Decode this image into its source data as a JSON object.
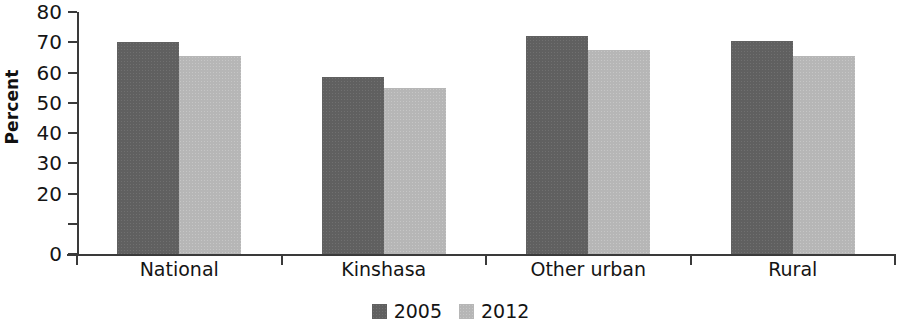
{
  "chart_data": {
    "type": "bar",
    "title": "",
    "subtitle": "",
    "xlabel": "",
    "ylabel": "Percent",
    "categories": [
      "National",
      "Kinshasa",
      "Other urban",
      "Rural"
    ],
    "series": [
      {
        "name": "2005",
        "color": "#606060",
        "values": [
          70,
          58.5,
          72,
          70.5
        ]
      },
      {
        "name": "2012",
        "color": "#b6b6b6",
        "values": [
          65.5,
          55,
          67.5,
          65.5
        ]
      }
    ],
    "ylim": [
      0,
      80
    ],
    "ytick_values": [
      80,
      70,
      60,
      50,
      40,
      30,
      20,
      10,
      0
    ],
    "ytick_labels": [
      "80",
      "70",
      "60",
      "50",
      "40",
      "30",
      "20",
      "",
      "0"
    ],
    "grid": false,
    "legend_position": "bottom-center",
    "legend_entries": [
      "2005",
      "2012"
    ],
    "annotations": [],
    "bar_layout": "grouped-adjacent"
  },
  "axis": {
    "y_title": "Percent"
  }
}
